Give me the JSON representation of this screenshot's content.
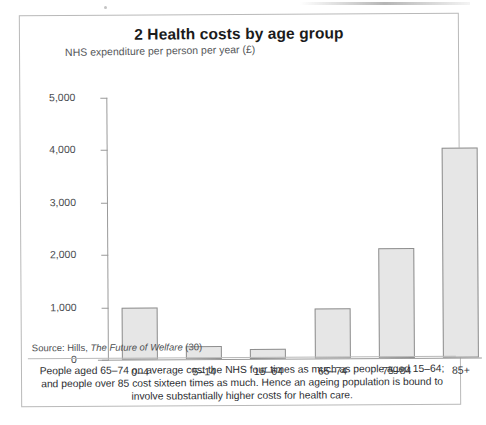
{
  "figure": {
    "title": "2 Health costs by age group",
    "source": {
      "prefix": "Source: Hills,",
      "italic": "The Future of Welfare",
      "suffix": "(30)"
    },
    "caption": "People aged 65–74 on average cost the NHS four times as much as people aged 15–64; and people over 85 cost sixteen times as much. Hence an ageing population is bound to involve substantially higher costs for health care."
  },
  "chart_data": {
    "type": "bar",
    "title": "2 Health costs by age group",
    "subtitle": "",
    "xlabel": "",
    "ylabel": "NHS expenditure per person per year (£)",
    "categories": [
      "0–4",
      "5–14",
      "15–64",
      "65–74",
      "75–84",
      "85+"
    ],
    "values": [
      1000,
      250,
      200,
      950,
      2100,
      4000
    ],
    "ylim": [
      0,
      5000
    ],
    "ytick_values": [
      0,
      1000,
      2000,
      3000,
      4000,
      5000
    ],
    "ytick_labels": [
      "0",
      "1,000",
      "2,000",
      "3,000",
      "4,000",
      "5,000"
    ],
    "grid": false,
    "legend": "none",
    "bar_fill": "#e6e6e6",
    "bar_border": "#8e8e8e"
  }
}
